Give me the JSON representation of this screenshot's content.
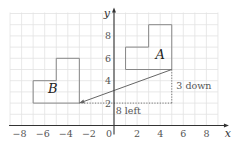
{
  "chart_data": {
    "type": "diagram",
    "title": "",
    "grid": {
      "on": true,
      "x_range": [
        -9,
        9
      ],
      "y_range": [
        0,
        10
      ],
      "step": 1
    },
    "axes": {
      "x": {
        "label": "x",
        "ticks": [
          -8,
          -6,
          -4,
          -2,
          0,
          2,
          4,
          6,
          8
        ],
        "tick_labels": [
          "−8",
          "−6",
          "−4",
          "−2",
          "0",
          "2",
          "4",
          "6",
          "8"
        ]
      },
      "y": {
        "label": "y",
        "ticks": [
          2,
          4,
          6,
          8
        ],
        "tick_labels": [
          "2",
          "4",
          "6",
          "8"
        ]
      }
    },
    "shapes": [
      {
        "name": "A",
        "label": "A",
        "vertices": [
          [
            1,
            5
          ],
          [
            5,
            5
          ],
          [
            5,
            9
          ],
          [
            3,
            9
          ],
          [
            3,
            7
          ],
          [
            1,
            7
          ]
        ],
        "label_pos": [
          4,
          5.9
        ]
      },
      {
        "name": "B",
        "label": "B",
        "vertices": [
          [
            -7,
            2
          ],
          [
            -3,
            2
          ],
          [
            -3,
            6
          ],
          [
            -5,
            6
          ],
          [
            -5,
            4
          ],
          [
            -7,
            4
          ]
        ],
        "label_pos": [
          -5.3,
          2.9
        ]
      }
    ],
    "translation_arrow": {
      "from": [
        5,
        5
      ],
      "to": [
        -3,
        2
      ]
    },
    "guides": [
      {
        "from": [
          5,
          5
        ],
        "to": [
          5,
          2
        ],
        "style": "dotted",
        "label": "3 down",
        "label_pos": [
          5.4,
          3.3
        ]
      },
      {
        "from": [
          5,
          2
        ],
        "to": [
          -3,
          2
        ],
        "style": "dotted",
        "label": "8 left",
        "label_pos": [
          0.15,
          1.0
        ]
      }
    ],
    "translation_vector": [
      -8,
      -3
    ]
  },
  "labels": {
    "x_axis": "x",
    "y_axis": "y",
    "origin": "0",
    "shape_a": "A",
    "shape_b": "B",
    "down_annotation": "3 down",
    "left_annotation": "8 left"
  },
  "colors": {
    "grid": "#e2e2e2",
    "axis": "#333333",
    "shape": "#888888",
    "arrow": "#666666",
    "guide": "#777777"
  }
}
